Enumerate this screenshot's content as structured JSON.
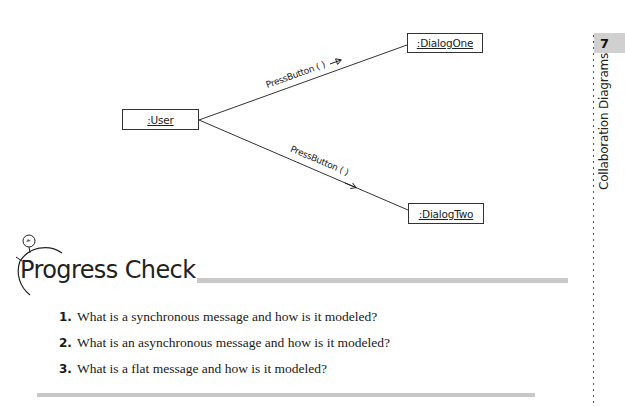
{
  "diagram": {
    "objects": [
      {
        "id": "user",
        "label": ":User"
      },
      {
        "id": "dialog_one",
        "label": ":DialogOne"
      },
      {
        "id": "dialog_two",
        "label": ":DialogTwo"
      }
    ],
    "messages": [
      {
        "from": "user",
        "to": "dialog_one",
        "label": "PressButton ( )",
        "arrow": "synchronous"
      },
      {
        "from": "user",
        "to": "dialog_two",
        "label": "PressButton ( )",
        "arrow": "asynchronous"
      }
    ]
  },
  "section": {
    "icon": "stopwatch-icon",
    "title": "Progress Check",
    "questions": [
      {
        "number": "1.",
        "text": "What is a synchronous message and how is it modeled?"
      },
      {
        "number": "2.",
        "text": "What is an asynchronous message and how is it modeled?"
      },
      {
        "number": "3.",
        "text": "What is a flat message and how is it modeled?"
      }
    ]
  },
  "sidebar": {
    "chapter_number": "7",
    "chapter_title": "Collaboration Diagrams"
  },
  "colors": {
    "rule_gray": "#c8c8c8",
    "tab_gray": "#d0d0d0",
    "ink": "#1a1a1a"
  }
}
